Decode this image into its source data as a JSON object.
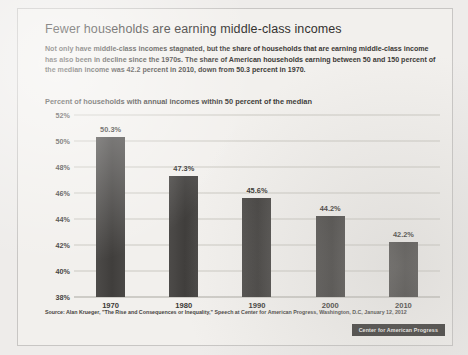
{
  "card": {
    "title": "Fewer households are earning middle-class incomes",
    "subtitle": "Not only have middle-class incomes stagnated, but the share of households that are earning middle-class income has also been in decline since the 1970s. The share of American households earning between 50 and 150 percent of the median income was 42.2 percent in 2010, down from 50.3 percent in 1970.",
    "source": "Source: Alan Krueger, \"The Rise and Consequences or Inequality,\" Speech at Center for American Progress, Washington, D.C, January 12, 2012",
    "badge": "Center for American Progress",
    "badge_color": "#3a3836"
  },
  "chart_data": {
    "type": "bar",
    "title": "Percent of households with annual incomes within 50 percent of the median",
    "xlabel": "",
    "ylabel": "",
    "categories": [
      "1970",
      "1980",
      "1990",
      "2000",
      "2010"
    ],
    "values": [
      50.3,
      47.3,
      45.6,
      44.2,
      42.2
    ],
    "value_labels": [
      "50.3%",
      "47.3%",
      "45.6%",
      "44.2%",
      "42.2%"
    ],
    "ylim": [
      38,
      52
    ],
    "yticks": [
      38,
      40,
      42,
      44,
      46,
      48,
      50,
      52
    ],
    "ytick_labels": [
      "38%",
      "40%",
      "42%",
      "44%",
      "46%",
      "48%",
      "50%",
      "52%"
    ],
    "grid": true,
    "legend": false,
    "bar_color": "#454341"
  }
}
